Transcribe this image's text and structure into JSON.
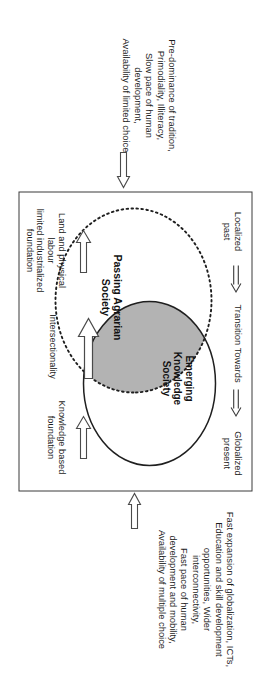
{
  "figure": {
    "axis": {
      "localized_past": "Localized\npast",
      "transition_towards": "Transition Towards",
      "globalized_present": "Globalized\npresent",
      "arrow_1": "double-arrow-right-icon",
      "arrow_2": "double-arrow-right-icon"
    },
    "ellipses": {
      "agrarian_label": "Passing Agrarian\nSociety",
      "knowledge_label": "Emerging\nKnowledge\nSociety",
      "overlap_fill": "#b3b3b3",
      "knowledge_stroke": "solid",
      "agrarian_stroke": "dotted"
    },
    "side_labels": {
      "land_labour": "Land and physical labour\nlimited industrialized\nfoundation",
      "intersectionality": "Intersectionality",
      "knowledge_based": "Knowledge based\nfoundation",
      "arrow_land_labour": "hollow-arrow-left-icon",
      "arrow_intersection": "hollow-arrow-left-icon",
      "arrow_knowledge_based": "hollow-arrow-left-icon"
    },
    "annotations": {
      "past_block": "Pre-dominance of tradition,\nPrimodiality, Illiteracy,\nSlow pace of human\ndevelopment,\nAvailability of limited choice",
      "present_block": "Fast expansion of globalization, ICTs,\nEducation and skill development\nopportunities, Wider\ninterconnectivity,\nFast pace of human\ndevelopment and mobility,\nAvailability of multiple choice",
      "past_arrow": "hollow-arrow-right-icon",
      "present_arrow": "hollow-arrow-left-icon"
    },
    "colors": {
      "frame_stroke": "#3b3b3b",
      "overlap_gray": "#b3b3b3",
      "text": "#1c1c1c",
      "background": "#ffffff"
    }
  }
}
